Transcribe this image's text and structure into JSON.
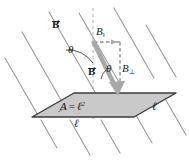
{
  "figure": {
    "name": "magnetic-flux-through-square-loop",
    "colors": {
      "field_line": "#9a9a9a",
      "plane_fill": "#c9c9c9",
      "plane_edge": "#3d3d3d",
      "vector_gray": "#a8a8a8",
      "dashed_gray": "#b0b0b0",
      "text": "#1a1a1a",
      "background": "#ffffff"
    },
    "labels": {
      "field_vector_upper": "B",
      "field_vector_lower": "B",
      "b_parallel": "B",
      "b_parallel_sub": "‖",
      "b_perp": "B",
      "b_perp_sub": "⊥",
      "theta_upper": "θ",
      "theta_lower": "θ",
      "area": "A",
      "equals": "=",
      "ell_area": "ℓ",
      "ell_exponent": "2",
      "ell_bottom": "ℓ",
      "ell_right": "ℓ"
    },
    "geometry": {
      "field_line_count": 6,
      "plane_vertices": "32,117 74,93 176,93 134,117",
      "b_vector_start_x": 93,
      "b_vector_start_y": 41,
      "b_vector_end_x": 119,
      "b_vector_end_y": 94,
      "b_parallel_x_end": 120,
      "b_perp_y_end": 93,
      "dashed_vertical_x": 93,
      "field_line_slope_deg": 60
    }
  }
}
